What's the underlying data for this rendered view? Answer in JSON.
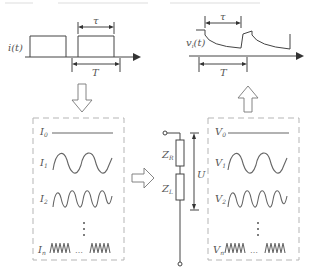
{
  "header": {
    "left_caption": "",
    "right_caption": ""
  },
  "input_signal": {
    "label": "i(t)",
    "pulse_width_label": "τ",
    "period_label": "T"
  },
  "output_signal": {
    "label": "v",
    "label_sub": "i",
    "label_suffix": "(t)",
    "pulse_width_label": "τ",
    "period_label": "T"
  },
  "current_components": {
    "items": [
      {
        "name": "I",
        "sub": "0",
        "waveform": "dc"
      },
      {
        "name": "I",
        "sub": "1",
        "waveform": "sine-2-cycles"
      },
      {
        "name": "I",
        "sub": "2",
        "waveform": "sine-4-cycles"
      },
      {
        "name": "I",
        "sub": "n",
        "waveform": "sine-high-freq"
      }
    ],
    "ellipsis": "⋮",
    "inline_ellipsis": "…"
  },
  "voltage_components": {
    "items": [
      {
        "name": "V",
        "sub": "0",
        "waveform": "dc"
      },
      {
        "name": "V",
        "sub": "1",
        "waveform": "sine-2-cycles"
      },
      {
        "name": "V",
        "sub": "2",
        "waveform": "sine-4-cycles"
      },
      {
        "name": "V",
        "sub": "n",
        "waveform": "sine-high-freq"
      }
    ],
    "ellipsis": "⋮",
    "inline_ellipsis": "…"
  },
  "circuit": {
    "upper_impedance": {
      "name": "Z",
      "sub": "R"
    },
    "lower_impedance": {
      "name": "Z",
      "sub": "L"
    },
    "voltage_label": "U"
  },
  "arrows": [
    {
      "id": "down",
      "direction": "down"
    },
    {
      "id": "right",
      "direction": "right"
    },
    {
      "id": "up",
      "direction": "up"
    }
  ],
  "colors": {
    "line": "#444444",
    "wave": "#666666",
    "dashed_box": "#b5b5b5",
    "background": "#ffffff"
  }
}
